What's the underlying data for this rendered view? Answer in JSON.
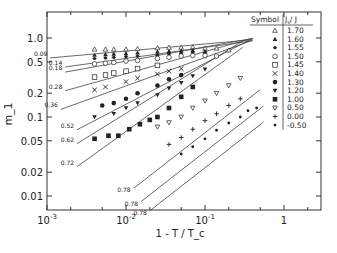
{
  "chart_data": {
    "type": "scatter",
    "title": "",
    "xlabel": "1 - T / T_c",
    "ylabel": "m_1",
    "xscale": "log",
    "yscale": "log",
    "xlim": [
      0.001,
      3.2
    ],
    "ylim": [
      0.006,
      3.0
    ],
    "x_ticks": [
      {
        "value": 0.001,
        "label": "10^-3"
      },
      {
        "value": 0.01,
        "label": "10^-2"
      },
      {
        "value": 0.1,
        "label": "10^-1"
      },
      {
        "value": 1,
        "label": "1"
      }
    ],
    "y_ticks": [
      {
        "value": 1.0,
        "label": "1.0"
      },
      {
        "value": 0.5,
        "label": "0.5"
      },
      {
        "value": 0.2,
        "label": "0.2"
      },
      {
        "value": 0.1,
        "label": "0.1"
      },
      {
        "value": 0.05,
        "label": "0.05"
      },
      {
        "value": 0.02,
        "label": "0.02"
      },
      {
        "value": 0.01,
        "label": "0.01"
      }
    ],
    "grid": false,
    "legend": {
      "position": "upper-right",
      "header": [
        "Symbol",
        "J_s / J"
      ],
      "entries": [
        {
          "symbol": "open-triangle-up",
          "label": "1.70"
        },
        {
          "symbol": "filled-triangle-up",
          "label": "1.60"
        },
        {
          "symbol": "asterisk-dot",
          "label": "1.55"
        },
        {
          "symbol": "open-circle",
          "label": "1.50"
        },
        {
          "symbol": "open-square",
          "label": "1.45"
        },
        {
          "symbol": "cross",
          "label": "1.40"
        },
        {
          "symbol": "filled-circle",
          "label": "1.30"
        },
        {
          "symbol": "filled-triangle-down",
          "label": "1.20"
        },
        {
          "symbol": "filled-square",
          "label": "1.00"
        },
        {
          "symbol": "open-triangle-down",
          "label": "0.50"
        },
        {
          "symbol": "plus",
          "label": "0.00"
        },
        {
          "symbol": "small-dot",
          "label": "-0.50"
        }
      ]
    },
    "fit_lines": [
      {
        "slope_label": "0.09",
        "x": [
          0.0011,
          0.4
        ],
        "y_start": 0.56,
        "exponent": 0.09
      },
      {
        "slope_label": "0.14",
        "x": [
          0.0017,
          0.4
        ],
        "y_start": 0.43,
        "exponent": 0.14
      },
      {
        "slope_label": "0.18",
        "x": [
          0.0017,
          0.4
        ],
        "y_start": 0.37,
        "exponent": 0.18
      },
      {
        "slope_label": "0.28",
        "x": [
          0.0017,
          0.4
        ],
        "y_start": 0.215,
        "exponent": 0.28
      },
      {
        "slope_label": "0.36",
        "x": [
          0.0015,
          0.4
        ],
        "y_start": 0.125,
        "exponent": 0.36
      },
      {
        "slope_label": "0.52",
        "x": [
          0.0024,
          0.4
        ],
        "y_start": 0.069,
        "exponent": 0.52
      },
      {
        "slope_label": "0.62",
        "x": [
          0.0024,
          0.3
        ],
        "y_start": 0.046,
        "exponent": 0.62
      },
      {
        "slope_label": "0.72",
        "x": [
          0.0024,
          0.3
        ],
        "y_start": 0.0235,
        "exponent": 0.72
      },
      {
        "slope_label": "0.78",
        "x": [
          0.0125,
          0.5
        ],
        "y_start": 0.0125,
        "exponent": 0.78
      },
      {
        "slope_label": "0.78",
        "x": [
          0.0155,
          0.55
        ],
        "y_start": 0.0085,
        "exponent": 0.78
      },
      {
        "slope_label": "0.78",
        "x": [
          0.02,
          0.55
        ],
        "y_start": 0.0065,
        "exponent": 0.78
      }
    ],
    "series": [
      {
        "name": "1.70",
        "symbol": "open-triangle-up",
        "x": [
          0.004,
          0.0055,
          0.007,
          0.01,
          0.014,
          0.025,
          0.035,
          0.05,
          0.07,
          0.1,
          0.14,
          0.2
        ],
        "y": [
          0.72,
          0.72,
          0.72,
          0.72,
          0.73,
          0.75,
          0.76,
          0.76,
          0.77,
          0.74,
          0.74,
          0.7
        ]
      },
      {
        "name": "1.60",
        "symbol": "filled-triangle-up",
        "x": [
          0.004,
          0.0055,
          0.007,
          0.01,
          0.014,
          0.025,
          0.035,
          0.05,
          0.07,
          0.1
        ],
        "y": [
          0.61,
          0.62,
          0.63,
          0.64,
          0.65,
          0.67,
          0.68,
          0.69,
          0.7,
          0.68
        ]
      },
      {
        "name": "1.55",
        "symbol": "asterisk-dot",
        "x": [
          0.004,
          0.0055,
          0.007,
          0.01,
          0.014,
          0.025,
          0.035,
          0.05,
          0.07,
          0.1
        ],
        "y": [
          0.55,
          0.56,
          0.57,
          0.58,
          0.59,
          0.61,
          0.63,
          0.64,
          0.65,
          0.64
        ]
      },
      {
        "name": "1.50",
        "symbol": "open-circle",
        "x": [
          0.004,
          0.0055,
          0.007,
          0.01,
          0.014,
          0.025,
          0.035,
          0.05,
          0.07,
          0.1,
          0.14
        ],
        "y": [
          0.47,
          0.48,
          0.49,
          0.51,
          0.52,
          0.55,
          0.57,
          0.59,
          0.6,
          0.6,
          0.59
        ]
      },
      {
        "name": "1.45",
        "symbol": "open-square",
        "x": [
          0.004,
          0.0055,
          0.007,
          0.01,
          0.014,
          0.025
        ],
        "y": [
          0.32,
          0.34,
          0.36,
          0.38,
          0.41,
          0.45
        ]
      },
      {
        "name": "1.40",
        "symbol": "cross",
        "x": [
          0.004,
          0.0055,
          0.01,
          0.014,
          0.025,
          0.035,
          0.05
        ],
        "y": [
          0.22,
          0.24,
          0.28,
          0.31,
          0.35,
          0.38,
          0.41
        ]
      },
      {
        "name": "1.30",
        "symbol": "filled-circle",
        "x": [
          0.005,
          0.007,
          0.01,
          0.014,
          0.025,
          0.035,
          0.05
        ],
        "y": [
          0.14,
          0.15,
          0.17,
          0.2,
          0.25,
          0.3,
          0.34
        ]
      },
      {
        "name": "1.20",
        "symbol": "filled-triangle-down",
        "x": [
          0.004,
          0.007,
          0.01,
          0.014,
          0.025,
          0.035,
          0.05,
          0.07,
          0.1
        ],
        "y": [
          0.1,
          0.11,
          0.13,
          0.15,
          0.19,
          0.23,
          0.27,
          0.33,
          0.4
        ]
      },
      {
        "name": "1.00",
        "symbol": "filled-square",
        "x": [
          0.004,
          0.006,
          0.008,
          0.011,
          0.015,
          0.02,
          0.025,
          0.035,
          0.05,
          0.07
        ],
        "y": [
          0.053,
          0.058,
          0.058,
          0.07,
          0.081,
          0.092,
          0.1,
          0.13,
          0.18,
          0.24
        ]
      },
      {
        "name": "0.50",
        "symbol": "open-triangle-down",
        "x": [
          0.025,
          0.035,
          0.05,
          0.07,
          0.1,
          0.14,
          0.2,
          0.28
        ],
        "y": [
          0.075,
          0.085,
          0.1,
          0.13,
          0.16,
          0.2,
          0.25,
          0.31
        ]
      },
      {
        "name": "0.00",
        "symbol": "plus",
        "x": [
          0.035,
          0.05,
          0.07,
          0.1,
          0.14,
          0.2,
          0.28
        ],
        "y": [
          0.045,
          0.055,
          0.07,
          0.09,
          0.11,
          0.14,
          0.17
        ]
      },
      {
        "name": "-0.50",
        "symbol": "small-dot",
        "x": [
          0.05,
          0.07,
          0.1,
          0.14,
          0.2,
          0.28,
          0.35,
          0.45
        ],
        "y": [
          0.034,
          0.042,
          0.053,
          0.068,
          0.084,
          0.1,
          0.12,
          0.13
        ]
      }
    ]
  }
}
